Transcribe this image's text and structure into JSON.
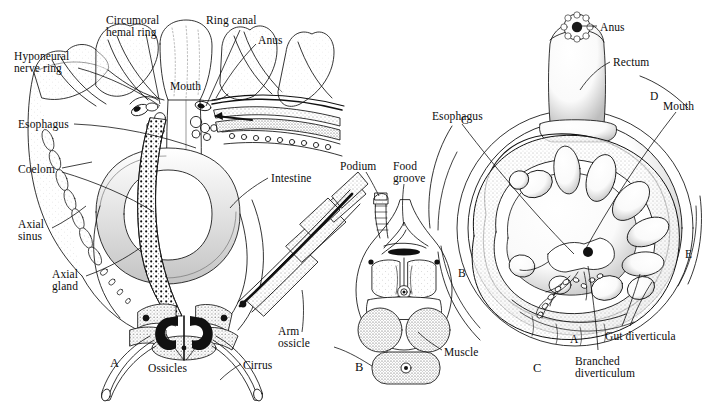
{
  "figure": {
    "background_color": "#ffffff",
    "ink_color": "#111111"
  },
  "panels": [
    {
      "id": "A",
      "letter": "A",
      "caption": "Sagittal section through the calyx",
      "letter_pos": {
        "x": 110,
        "y": 356
      }
    },
    {
      "id": "B",
      "letter": "B",
      "caption": "Cross section of an arm",
      "letter_pos": {
        "x": 355,
        "y": 360
      }
    },
    {
      "id": "C",
      "letter": "C",
      "caption": "Oral view of the disc showing the gut",
      "letter_pos": {
        "x": 533,
        "y": 361
      }
    }
  ],
  "labels_panel_a": [
    {
      "name": "hyponeural-nerve-ring",
      "text": "Hyponeural\nnerve ring",
      "x": 14,
      "y": 50,
      "align": "left"
    },
    {
      "name": "circumoral-hemal-ring",
      "text": "Circumoral\nhemal ring",
      "x": 106,
      "y": 14,
      "align": "left"
    },
    {
      "name": "ring-canal",
      "text": "Ring canal",
      "x": 206,
      "y": 14,
      "align": "left"
    },
    {
      "name": "anus",
      "text": "Anus",
      "x": 258,
      "y": 34,
      "align": "left"
    },
    {
      "name": "mouth",
      "text": "Mouth",
      "x": 170,
      "y": 80,
      "align": "left"
    },
    {
      "name": "esophagus",
      "text": "Esophagus",
      "x": 18,
      "y": 118,
      "align": "left"
    },
    {
      "name": "coelom",
      "text": "Coelom",
      "x": 18,
      "y": 163,
      "align": "left"
    },
    {
      "name": "axial-sinus",
      "text": "Axial\nsinus",
      "x": 18,
      "y": 218,
      "align": "left"
    },
    {
      "name": "axial-gland",
      "text": "Axial\ngland",
      "x": 52,
      "y": 268,
      "align": "left"
    },
    {
      "name": "intestine",
      "text": "Intestine",
      "x": 271,
      "y": 172,
      "align": "left"
    },
    {
      "name": "arm-ossicle",
      "text": "Arm\nossicle",
      "x": 278,
      "y": 325,
      "align": "left"
    },
    {
      "name": "ossicles",
      "text": "Ossicles",
      "x": 148,
      "y": 362,
      "align": "left"
    },
    {
      "name": "cirrus",
      "text": "Cirrus",
      "x": 243,
      "y": 359,
      "align": "left"
    }
  ],
  "labels_panel_b": [
    {
      "name": "podium",
      "text": "Podium",
      "x": 340,
      "y": 160,
      "align": "left"
    },
    {
      "name": "food-groove",
      "text": "Food\ngroove",
      "x": 393,
      "y": 160,
      "align": "left"
    },
    {
      "name": "muscle",
      "text": "Muscle",
      "x": 444,
      "y": 346,
      "align": "left"
    }
  ],
  "labels_panel_c": [
    {
      "name": "anus-c",
      "text": "Anus",
      "x": 600,
      "y": 21,
      "align": "left"
    },
    {
      "name": "rectum",
      "text": "Rectum",
      "x": 613,
      "y": 56,
      "align": "left"
    },
    {
      "name": "esophagus-c",
      "text": "Esophagus",
      "x": 432,
      "y": 110,
      "align": "left"
    },
    {
      "name": "mouth-c",
      "text": "Mouth",
      "x": 663,
      "y": 100,
      "align": "left"
    },
    {
      "name": "gut-diverticula",
      "text": "Gut diverticula",
      "x": 605,
      "y": 330,
      "align": "left"
    },
    {
      "name": "branched-diverticulum",
      "text": "Branched\ndiverticulum",
      "x": 575,
      "y": 355,
      "align": "left"
    }
  ],
  "arm_letters_panel_c": [
    {
      "name": "arm-letter-c",
      "text": "C",
      "x": 461,
      "y": 114
    },
    {
      "name": "arm-letter-d",
      "text": "D",
      "x": 650,
      "y": 90
    },
    {
      "name": "arm-letter-b",
      "text": "B",
      "x": 458,
      "y": 267
    },
    {
      "name": "arm-letter-e",
      "text": "E",
      "x": 685,
      "y": 248
    },
    {
      "name": "arm-letter-a",
      "text": "A",
      "x": 570,
      "y": 333
    }
  ]
}
